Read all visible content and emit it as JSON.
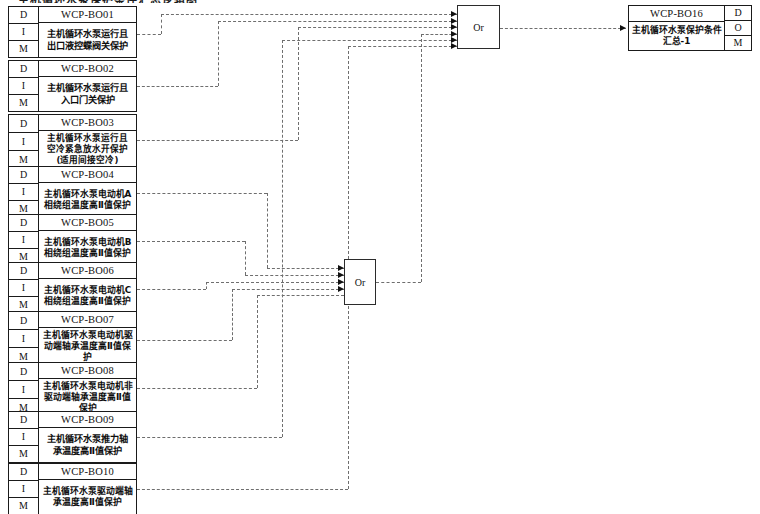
{
  "title_sliver": "主机循环水泵保护条件汇总逻辑图",
  "row_labels": {
    "d": "D",
    "i": "I",
    "m": "M",
    "o": "O"
  },
  "gates": {
    "or_label": "Or",
    "gate_top": {
      "label": "Or",
      "input_count": 6
    },
    "gate_mid": {
      "label": "Or",
      "input_count": 4
    }
  },
  "signals": [
    {
      "tag": "WCP-BO01",
      "desc": "主机循环水泵运行且\n出口液控蝶阀关保护",
      "lines": 2
    },
    {
      "tag": "WCP-BO02",
      "desc": "主机循环水泵运行且\n入口门关保护",
      "lines": 2
    },
    {
      "tag": "WCP-BO03",
      "desc": "主机循环水泵运行且\n空冷紧急放水开保护\n(适用间接空冷)",
      "lines": 3
    },
    {
      "tag": "WCP-BO04",
      "desc": "主机循环水泵电动机A\n相绕组温度高Ⅱ值保护",
      "lines": 2
    },
    {
      "tag": "WCP-BO05",
      "desc": "主机循环水泵电动机B\n相绕组温度高Ⅱ值保护",
      "lines": 2
    },
    {
      "tag": "WCP-BO06",
      "desc": "主机循环水泵电动机C\n相绕组温度高Ⅱ值保护",
      "lines": 2
    },
    {
      "tag": "WCP-BO07",
      "desc": "主机循环水泵电动机驱\n动端轴承温度高Ⅱ值保\n护",
      "lines": 3
    },
    {
      "tag": "WCP-BO08",
      "desc": "主机循环水泵电动机非\n驱动端轴承温度高Ⅱ值\n保护",
      "lines": 3
    },
    {
      "tag": "WCP-BO09",
      "desc": "主机循环水泵推力轴\n承温度高Ⅱ值保护",
      "lines": 2
    },
    {
      "tag": "WCP-BO10",
      "desc": "主机循环水泵驱动端轴\n承温度高Ⅱ值保护",
      "lines": 2
    }
  ],
  "output": {
    "tag": "WCP-BO16",
    "desc": "主机循环水泵保护条件\n汇总-1"
  },
  "colors": {
    "line": "#1a1a1a",
    "wire": "#6e6e6e",
    "background": "#ffffff"
  }
}
